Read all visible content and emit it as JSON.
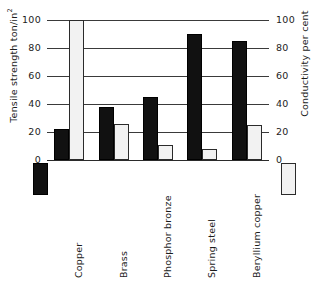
{
  "chart_data": {
    "type": "bar",
    "title": "",
    "subtitle": "",
    "xlabel": "",
    "ylabel": "Tensile strength ton/in",
    "ylabel_superscript": "2",
    "y2label": "Conductivity per cent",
    "categories": [
      "Copper",
      "Brass",
      "Phosphor bronze",
      "Spring steel",
      "Beryllium copper"
    ],
    "series": [
      {
        "name": "Tensile strength ton/in2",
        "axis": "left",
        "style": "solid-black",
        "color": "#111111",
        "values": [
          22,
          38,
          45,
          90,
          85
        ]
      },
      {
        "name": "Conductivity per cent",
        "axis": "right",
        "style": "dotted-light",
        "color": "#f2f2f2",
        "values": [
          100,
          26,
          11,
          8,
          25
        ]
      }
    ],
    "ylim": [
      0,
      100
    ],
    "y2lim": [
      0,
      100
    ],
    "yticks": [
      0,
      20,
      40,
      60,
      80,
      100
    ],
    "y2ticks": [
      0,
      20,
      40,
      60,
      80,
      100
    ],
    "ytick_labels": [
      "0",
      "20",
      "40",
      "60",
      "80",
      "100"
    ],
    "y2tick_labels": [
      "0",
      "20",
      "40",
      "60",
      "80",
      "100"
    ],
    "grid": true,
    "grid_axis": "y",
    "legend_position": "below-axis-outer",
    "legend": [
      {
        "label": "Tensile strength ton/in2",
        "swatch": "solid-black"
      },
      {
        "label": "Conductivity per cent",
        "swatch": "dotted-light"
      }
    ]
  },
  "axes": {
    "left": {
      "title": "Tensile strength ton/in",
      "title_sup": "2",
      "ticks": [
        {
          "value": 100,
          "label": "100"
        },
        {
          "value": 80,
          "label": "80"
        },
        {
          "value": 60,
          "label": "60"
        },
        {
          "value": 40,
          "label": "40"
        },
        {
          "value": 20,
          "label": "20"
        },
        {
          "value": 0,
          "label": "0"
        }
      ]
    },
    "right": {
      "title": "Conductivity per cent",
      "ticks": [
        {
          "value": 100,
          "label": "100"
        },
        {
          "value": 80,
          "label": "80"
        },
        {
          "value": 60,
          "label": "60"
        },
        {
          "value": 40,
          "label": "40"
        },
        {
          "value": 20,
          "label": "20"
        },
        {
          "value": 0,
          "label": "0"
        }
      ]
    }
  },
  "categories": [
    {
      "label": "Copper",
      "tensile": 22,
      "conductivity": 100
    },
    {
      "label": "Brass",
      "tensile": 38,
      "conductivity": 26
    },
    {
      "label": "Phosphor bronze",
      "tensile": 45,
      "conductivity": 11
    },
    {
      "label": "Spring steel",
      "tensile": 90,
      "conductivity": 8
    },
    {
      "label": "Beryllium copper",
      "tensile": 85,
      "conductivity": 25
    }
  ]
}
